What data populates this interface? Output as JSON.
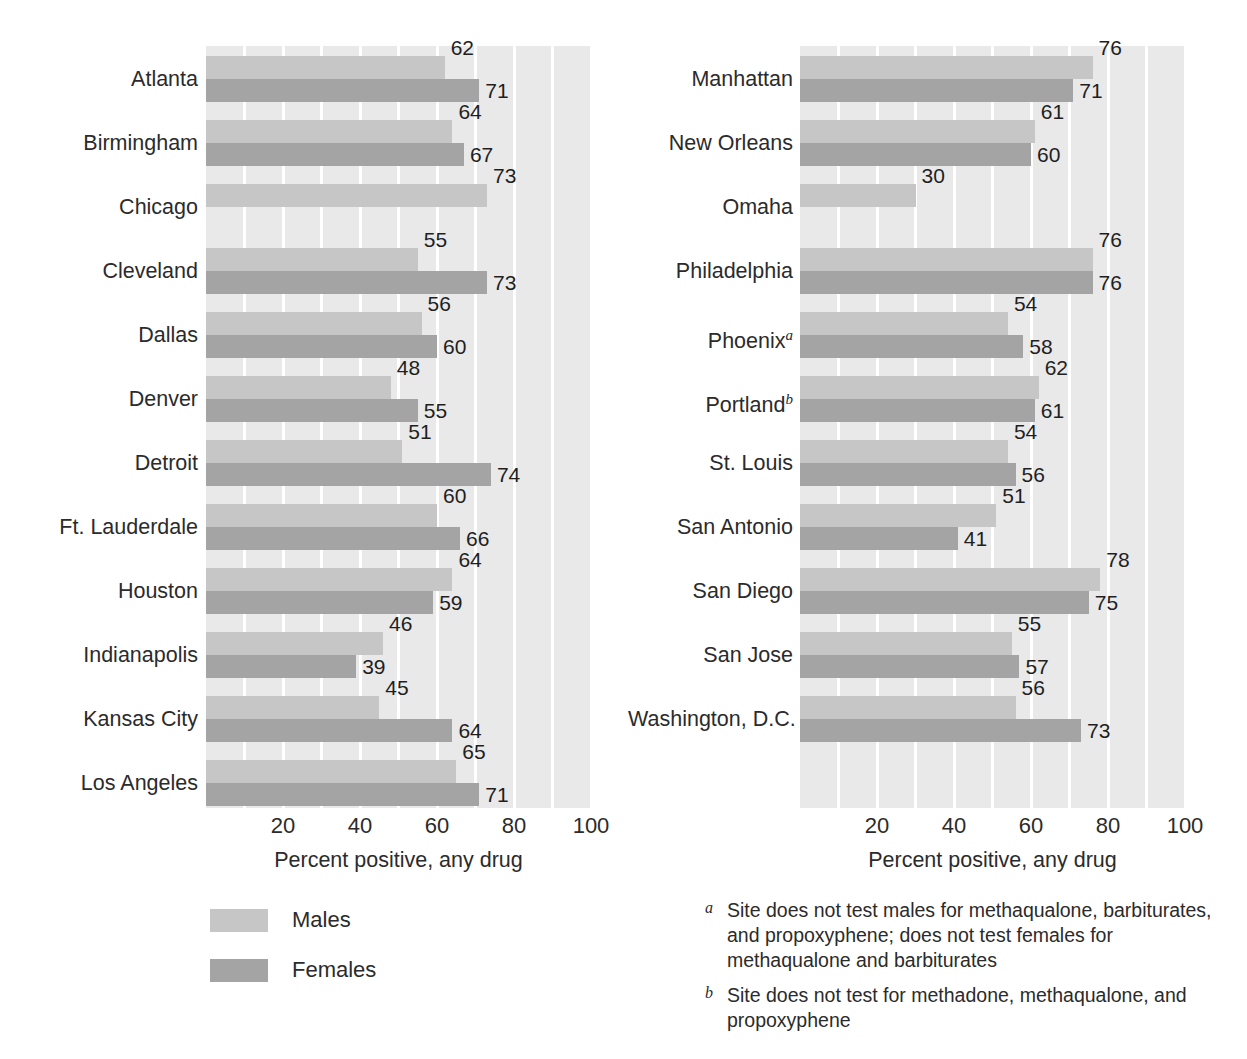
{
  "chart_data": {
    "type": "bar",
    "orientation": "horizontal",
    "title": "",
    "xlabel": "Percent positive, any drug",
    "ylabel": "",
    "xlim": [
      0,
      100
    ],
    "xticks": [
      20,
      40,
      60,
      80,
      100
    ],
    "xtick_labels": [
      "20",
      "40",
      "60",
      "80",
      "100"
    ],
    "gridlines": [
      10,
      20,
      30,
      40,
      50,
      60,
      70,
      80,
      90,
      100
    ],
    "grid": true,
    "legend": [
      "Males",
      "Females"
    ],
    "legend_position": "below-left-panel",
    "colors": {
      "males": "#c6c6c6",
      "females": "#a4a4a4",
      "plot_background": "#e9e9e9",
      "gridline": "#ffffff",
      "page_background": "#ffffff",
      "text": "#2b2b2b"
    },
    "panels": [
      {
        "id": "left",
        "xlabel": "Percent positive, any drug",
        "categories": [
          "Atlanta",
          "Birmingham",
          "Chicago",
          "Cleveland",
          "Dallas",
          "Denver",
          "Detroit",
          "Ft. Lauderdale",
          "Houston",
          "Indianapolis",
          "Kansas City",
          "Los Angeles"
        ],
        "series": [
          {
            "name": "Males",
            "values": [
              62,
              64,
              73,
              55,
              56,
              48,
              51,
              60,
              64,
              46,
              45,
              65
            ]
          },
          {
            "name": "Females",
            "values": [
              71,
              67,
              null,
              73,
              60,
              55,
              74,
              66,
              59,
              39,
              64,
              71
            ]
          }
        ]
      },
      {
        "id": "right",
        "xlabel": "Percent positive, any drug",
        "categories": [
          "Manhattan",
          "New Orleans",
          "Omaha",
          "Philadelphia",
          "Phoenix",
          "Portland",
          "St. Louis",
          "San Antonio",
          "San Diego",
          "San Jose",
          "Washington, D.C."
        ],
        "category_footnotes": [
          null,
          null,
          null,
          null,
          "a",
          "b",
          null,
          null,
          null,
          null,
          null
        ],
        "series": [
          {
            "name": "Males",
            "values": [
              76,
              61,
              30,
              76,
              54,
              62,
              54,
              51,
              78,
              55,
              56
            ]
          },
          {
            "name": "Females",
            "values": [
              71,
              60,
              null,
              76,
              58,
              61,
              56,
              41,
              75,
              57,
              73
            ]
          }
        ]
      }
    ],
    "footnotes": [
      {
        "marker": "a",
        "text": "Site does not test males for methaqualone, barbiturates, and propoxyphene; does not test females for methaqualone and barbiturates"
      },
      {
        "marker": "b",
        "text": "Site does not test for methadone, methaqualone, and propoxyphene"
      }
    ]
  }
}
